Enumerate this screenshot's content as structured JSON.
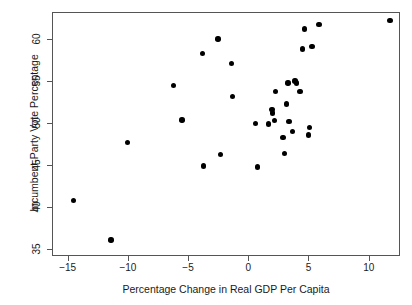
{
  "chart_data": {
    "type": "scatter",
    "title": "",
    "xlabel": "Percentage Change in Real GDP Per Capita",
    "ylabel": "Incumbent-Party Vote Percentage",
    "xlim": [
      -16.3,
      12.6
    ],
    "ylim": [
      34.2,
      63.2
    ],
    "grid": false,
    "legend": null,
    "xticks": [
      -15,
      -10,
      -5,
      0,
      5,
      10
    ],
    "xtick_labels": [
      "−15",
      "−10",
      "−5",
      "0",
      "5",
      "10"
    ],
    "yticks": [
      35,
      40,
      45,
      50,
      55,
      60
    ],
    "ytick_labels": [
      "35",
      "40",
      "45",
      "50",
      "55",
      "60"
    ],
    "marker": "filled-circle",
    "marker_color": "#000000",
    "points": [
      {
        "x": -14.6,
        "y": 40.9
      },
      {
        "x": -11.5,
        "y": 36.2
      },
      {
        "x": -10.1,
        "y": 47.8
      },
      {
        "x": -6.3,
        "y": 54.6
      },
      {
        "x": -5.6,
        "y": 50.5
      },
      {
        "x": -3.9,
        "y": 58.4
      },
      {
        "x": -3.8,
        "y": 45.0
      },
      {
        "x": -2.6,
        "y": 60.1
      },
      {
        "x": -2.4,
        "y": 46.4
      },
      {
        "x": -1.5,
        "y": 57.2
      },
      {
        "x": -1.4,
        "y": 53.3
      },
      {
        "x": 0.5,
        "y": 50.1
      },
      {
        "x": 0.7,
        "y": 44.9
      },
      {
        "x": 1.6,
        "y": 50.0
      },
      {
        "x": 1.9,
        "y": 51.7
      },
      {
        "x": 1.95,
        "y": 51.3
      },
      {
        "x": 2.1,
        "y": 50.4
      },
      {
        "x": 2.2,
        "y": 53.9
      },
      {
        "x": 2.8,
        "y": 48.4
      },
      {
        "x": 2.9,
        "y": 46.5
      },
      {
        "x": 3.1,
        "y": 52.4
      },
      {
        "x": 3.2,
        "y": 54.9
      },
      {
        "x": 3.3,
        "y": 50.3
      },
      {
        "x": 3.6,
        "y": 49.1
      },
      {
        "x": 3.8,
        "y": 55.1
      },
      {
        "x": 3.9,
        "y": 54.9
      },
      {
        "x": 4.2,
        "y": 53.9
      },
      {
        "x": 4.4,
        "y": 58.9
      },
      {
        "x": 4.6,
        "y": 61.3
      },
      {
        "x": 4.9,
        "y": 48.7
      },
      {
        "x": 5.0,
        "y": 49.6
      },
      {
        "x": 5.2,
        "y": 59.2
      },
      {
        "x": 5.8,
        "y": 61.8
      },
      {
        "x": 11.7,
        "y": 62.3
      }
    ]
  }
}
